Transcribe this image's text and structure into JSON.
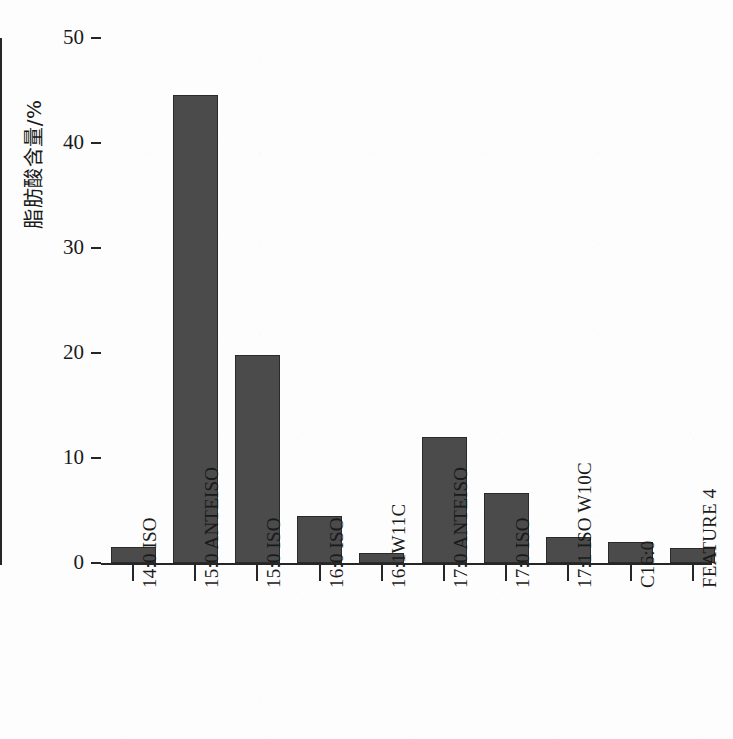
{
  "chart_data": {
    "type": "bar",
    "title": "",
    "xlabel": "",
    "ylabel": "脂肪酸含量/%",
    "ylim": [
      0,
      50
    ],
    "yticks": [
      0,
      10,
      20,
      30,
      40,
      50
    ],
    "grid": false,
    "legend": "none",
    "bar_color": "#4b4b4b",
    "bar_edge_color": "#2a2a2a",
    "background_color": "#fdfdfd",
    "categories": [
      "14:0 ISO",
      "15:0 ANTEISO",
      "15:0 ISO",
      "16:0 ISO",
      "16:1W11C",
      "17:0 ANTEISO",
      "17:0 ISO",
      "17:1 ISO W10C",
      "C16:0",
      "FEATURE 4"
    ],
    "values": [
      1.5,
      44.6,
      19.8,
      4.5,
      1.0,
      12.0,
      6.7,
      2.5,
      2.0,
      1.4
    ]
  }
}
